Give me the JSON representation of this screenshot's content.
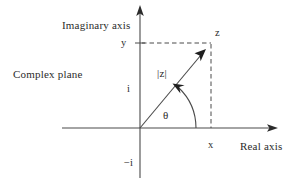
{
  "diagram": {
    "title_label": "Complex plane",
    "axes": {
      "imaginary_label": "Imaginary axis",
      "real_label": "Real axis"
    },
    "labels": {
      "point": "z",
      "magnitude": "|z|",
      "angle": "θ",
      "x_coord": "x",
      "y_coord": "y",
      "unit_imaginary": "i",
      "neg_unit_imaginary": "−i"
    },
    "colors": {
      "stroke": "#4a4a4a",
      "text": "#2b2b2b",
      "background": "#ffffff"
    },
    "geometry": {
      "origin": [
        140,
        128
      ],
      "point_z": [
        211,
        43
      ],
      "imaginary_axis_top": [
        140,
        6
      ],
      "imaginary_axis_bottom": [
        140,
        178
      ],
      "real_axis_left": [
        62,
        128
      ],
      "real_axis_right": [
        277,
        128
      ],
      "arrow_tip": [
        205,
        50
      ],
      "angle_arc_radius": 56
    }
  }
}
